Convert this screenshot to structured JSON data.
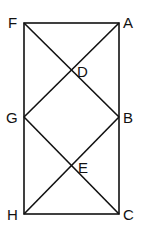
{
  "diagram": {
    "points": {
      "F": {
        "label": "F",
        "x": 24,
        "y": 23
      },
      "A": {
        "label": "A",
        "x": 119,
        "y": 23
      },
      "G": {
        "label": "G",
        "x": 24,
        "y": 117
      },
      "B": {
        "label": "B",
        "x": 119,
        "y": 117
      },
      "H": {
        "label": "H",
        "x": 24,
        "y": 214
      },
      "C": {
        "label": "C",
        "x": 119,
        "y": 214
      },
      "D": {
        "label": "D",
        "x": 71,
        "y": 70
      },
      "E": {
        "label": "E",
        "x": 71,
        "y": 166
      }
    },
    "segments": [
      "FA",
      "AC",
      "CH",
      "HF",
      "FB",
      "GA",
      "GC",
      "HB"
    ]
  }
}
